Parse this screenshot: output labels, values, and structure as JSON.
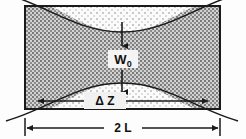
{
  "figure": {
    "kind": "gaussian-beam-waist-diagram",
    "title": "",
    "background_color": "#fdfdfd",
    "line_color": "#1a1a1a",
    "cavity": {
      "label": "2 L",
      "left_px": 25,
      "right_px": 220,
      "top_px": 6,
      "bottom_px": 109,
      "fill_light": "#f2f2f2",
      "fill_dark": "#b9b9b9"
    },
    "labels": {
      "waist": "W",
      "waist_subscript": "0",
      "rayleigh_range": "Δ Z",
      "cavity_length": "2 L"
    },
    "dimensions": [
      {
        "name": "waist-vertical",
        "label": "W0",
        "orientation": "vertical",
        "from_px": 22,
        "to_px": 92,
        "at_px": 122
      },
      {
        "name": "rayleigh-range",
        "label": "Δ Z",
        "orientation": "horizontal",
        "from_px": 38,
        "to_px": 208,
        "at_px": 101
      },
      {
        "name": "cavity-length",
        "label": "2 L",
        "orientation": "horizontal",
        "from_px": 25,
        "to_px": 220,
        "at_px": 128
      }
    ],
    "curves": {
      "description": "Hyperbolic beam envelope, symmetric about mid-height; narrow waist at center widening toward both ends, extending beyond the cavity walls.",
      "waist_half_width_px": 26,
      "edge_half_width_px": 58
    }
  }
}
